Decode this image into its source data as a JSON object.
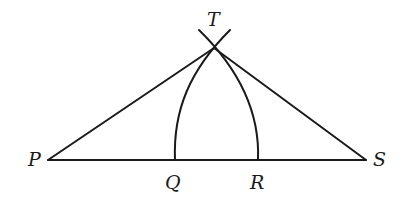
{
  "diagram": {
    "type": "geometric-construction",
    "points": {
      "P": {
        "label": "P",
        "x": 48,
        "y": 160
      },
      "Q": {
        "label": "Q",
        "x": 175,
        "y": 160
      },
      "R": {
        "label": "R",
        "x": 258,
        "y": 160
      },
      "S": {
        "label": "S",
        "x": 366,
        "y": 160
      },
      "T": {
        "label": "T",
        "x": 214,
        "y": 48
      }
    },
    "segments": [
      "PS",
      "PT",
      "ST"
    ],
    "arcs": [
      {
        "name": "arc-centered-S-through-Q",
        "center": "S",
        "from": "Q",
        "through": "T"
      },
      {
        "name": "arc-centered-P-through-R",
        "center": "P",
        "from": "R",
        "through": "T"
      }
    ],
    "colors": {
      "stroke": "#1a1a1a",
      "background": "#ffffff"
    }
  }
}
